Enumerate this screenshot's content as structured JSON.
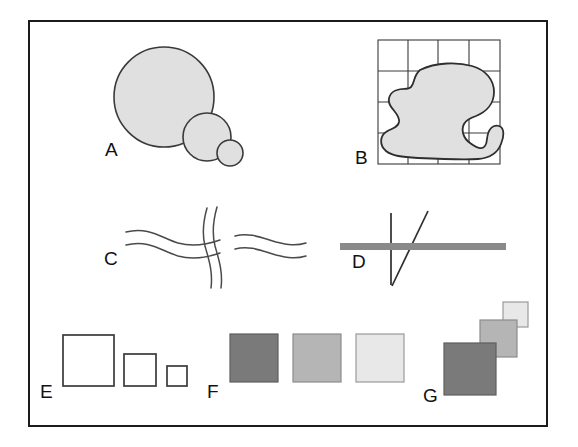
{
  "figure": {
    "caption": "FIGURE 10-10",
    "border_color": "#1c1c1c",
    "background": "#ffffff"
  },
  "palette": {
    "outline": "#3a3a3a",
    "blob_fill": "#e0e0e0",
    "dark_gray": "#7a7a7a",
    "medium_gray": "#b5b5b5",
    "light_gray": "#e8e8e8",
    "bar_gray": "#8a8a8a",
    "white": "#ffffff"
  },
  "panels": [
    {
      "id": "A",
      "label": "A",
      "description": "three overlapping filled circles of decreasing size",
      "shapes": [
        {
          "kind": "circle",
          "cx": 164,
          "cy": 97,
          "r": 50,
          "fill": "#e0e0e0"
        },
        {
          "kind": "circle",
          "cx": 207,
          "cy": 137,
          "r": 24,
          "fill": "#e0e0e0"
        },
        {
          "kind": "circle",
          "cx": 230,
          "cy": 153,
          "r": 13,
          "fill": "#e0e0e0"
        }
      ]
    },
    {
      "id": "B",
      "label": "B",
      "description": "irregular filled blob superimposed on a four by four grid",
      "grid": {
        "x": 378,
        "y": 40,
        "width": 122,
        "height": 124,
        "rows": 4,
        "cols": 4
      }
    },
    {
      "id": "C",
      "label": "C",
      "description": "two wavy double-line strips crossing, vertical strip passing over horizontal"
    },
    {
      "id": "D",
      "label": "D",
      "description": "thick gray horizontal bar crossed by a thin vertical line and a thin diagonal line"
    },
    {
      "id": "E",
      "label": "E",
      "description": "three white outlined squares decreasing in size, aligned on a common baseline",
      "squares": [
        {
          "x": 63,
          "y": 335,
          "size": 51,
          "fill": "#ffffff"
        },
        {
          "x": 124,
          "y": 355,
          "size": 32,
          "fill": "#ffffff"
        },
        {
          "x": 167,
          "y": 368,
          "size": 20,
          "fill": "#ffffff"
        }
      ]
    },
    {
      "id": "F",
      "label": "F",
      "description": "three equal squares decreasing in gray value from dark to light",
      "squares": [
        {
          "x": 230,
          "y": 334,
          "size": 48,
          "fill": "#7a7a7a"
        },
        {
          "x": 293,
          "y": 334,
          "size": 48,
          "fill": "#b5b5b5"
        },
        {
          "x": 356,
          "y": 334,
          "size": 48,
          "fill": "#e8e8e8"
        }
      ]
    },
    {
      "id": "G",
      "label": "G",
      "description": "three overlapping squares in a diagonal staircase, dark and large at lower left to light and small at upper right",
      "squares": [
        {
          "x": 503,
          "y": 302,
          "size": 25,
          "fill": "#e8e8e8"
        },
        {
          "x": 480,
          "y": 320,
          "size": 37,
          "fill": "#b5b5b5"
        },
        {
          "x": 444,
          "y": 343,
          "size": 52,
          "fill": "#7a7a7a"
        }
      ]
    }
  ],
  "labels": {
    "a": "A",
    "b": "B",
    "c": "C",
    "d": "D",
    "e": "E",
    "f": "F",
    "g": "G"
  }
}
